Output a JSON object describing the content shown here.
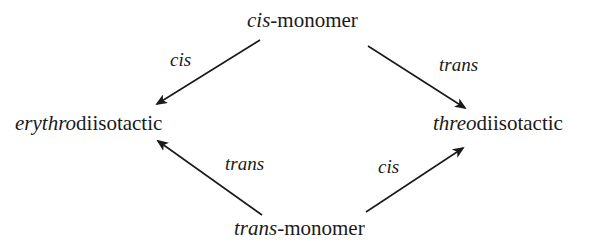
{
  "diagram": {
    "type": "reaction-scheme",
    "nodes": {
      "top": {
        "prefix": "cis",
        "suffix": "-monomer"
      },
      "left": {
        "prefix": "erythro",
        "suffix": "diisotactic"
      },
      "right": {
        "prefix": "threo",
        "suffix": "diisotactic"
      },
      "bottom": {
        "prefix": "trans",
        "suffix": "-monomer"
      }
    },
    "edges": [
      {
        "from": "cis-monomer",
        "to": "erythrodiisotactic",
        "label": "cis"
      },
      {
        "from": "cis-monomer",
        "to": "threodiisotactic",
        "label": "trans"
      },
      {
        "from": "trans-monomer",
        "to": "erythrodiisotactic",
        "label": "trans"
      },
      {
        "from": "trans-monomer",
        "to": "threodiisotactic",
        "label": "cis"
      }
    ],
    "colors": {
      "ink": "#1a1a1a",
      "background": "#ffffff"
    }
  }
}
